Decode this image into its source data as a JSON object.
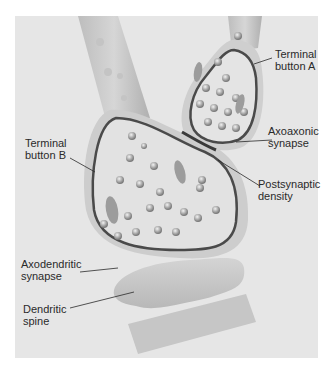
{
  "figure": {
    "labels": {
      "terminal_a": "Terminal\nbutton A",
      "axoaxonic": "Axoaxonic\nsynapse",
      "postsynaptic": "Postsynaptic\ndensity",
      "terminal_b": "Terminal\nbutton B",
      "axodendritic": "Axodendritic\nsynapse",
      "dendritic_spine": "Dendritic\nspine"
    },
    "colors": {
      "background": "#e6e6e6",
      "membrane": "#4a4a4a",
      "axon_fill": "#cfcfcf",
      "vesicle": "#9a9a9a"
    }
  }
}
